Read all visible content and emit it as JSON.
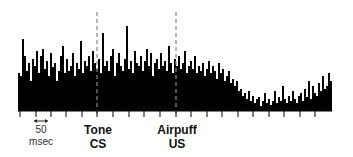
{
  "chart_data": {
    "type": "bar",
    "title": "",
    "xlabel": "",
    "ylabel": "",
    "grid": false,
    "bar_color": "#000000",
    "background": "#ffffff",
    "plot_area": {
      "x0": 18,
      "x1": 332,
      "baseline_y": 111,
      "max_height_px": 100
    },
    "bin_width_px": 2,
    "time_scale": {
      "label_value": "50",
      "label_unit": "msec",
      "tick_spacing_px": 15.6
    },
    "ticks_x_px": [
      20,
      36,
      51,
      66,
      82,
      97,
      113,
      129,
      144,
      160,
      176,
      191,
      207,
      222,
      238,
      253,
      269,
      284,
      300,
      315
    ],
    "events": [
      {
        "name": "Tone",
        "sub": "CS",
        "x_px": 97,
        "line": "dashed"
      },
      {
        "name": "Airpuff",
        "sub": "US",
        "x_px": 176,
        "line": "dashed"
      }
    ],
    "values": [
      38,
      35,
      72,
      55,
      40,
      48,
      30,
      52,
      45,
      60,
      38,
      55,
      62,
      42,
      50,
      35,
      58,
      44,
      48,
      30,
      40,
      55,
      65,
      38,
      52,
      40,
      45,
      58,
      35,
      48,
      42,
      70,
      38,
      50,
      45,
      55,
      40,
      60,
      48,
      42,
      52,
      38,
      78,
      45,
      50,
      40,
      55,
      62,
      35,
      48,
      58,
      45,
      40,
      52,
      85,
      42,
      50,
      38,
      60,
      48,
      45,
      55,
      40,
      50,
      62,
      45,
      58,
      35,
      48,
      52,
      42,
      58,
      45,
      50,
      40,
      65,
      48,
      38,
      52,
      45,
      55,
      42,
      48,
      60,
      38,
      45,
      50,
      42,
      55,
      38,
      45,
      40,
      48,
      35,
      42,
      50,
      38,
      45,
      40,
      32,
      48,
      38,
      42,
      30,
      35,
      40,
      28,
      32,
      25,
      30,
      20,
      22,
      15,
      18,
      12,
      20,
      10,
      15,
      8,
      12,
      14,
      5,
      10,
      18,
      8,
      12,
      6,
      10,
      20,
      8,
      14,
      10,
      25,
      12,
      8,
      15,
      10,
      20,
      12,
      8,
      15,
      18,
      10,
      22,
      14,
      30,
      12,
      25,
      18,
      15,
      28,
      20,
      35,
      22,
      25,
      38,
      30,
      42,
      35,
      28
    ],
    "values_right": [
      40,
      55,
      48,
      60,
      52,
      45,
      70,
      58,
      50,
      65,
      55,
      48,
      72,
      60,
      52,
      58,
      50,
      62,
      55,
      48,
      66,
      80,
      58,
      62,
      70,
      52,
      48,
      60,
      75,
      90,
      62,
      55,
      68,
      50,
      58,
      64,
      48,
      60,
      55,
      70,
      52,
      58,
      65,
      50,
      62,
      58,
      55,
      68,
      50,
      60,
      52,
      62,
      55,
      58,
      48,
      70,
      52,
      60,
      55,
      50,
      58,
      48,
      55,
      52
    ]
  },
  "labels": {
    "scale_value": "50",
    "scale_unit": "msec",
    "tone": "Tone",
    "cs": "CS",
    "airpuff": "Airpuff",
    "us": "US"
  }
}
